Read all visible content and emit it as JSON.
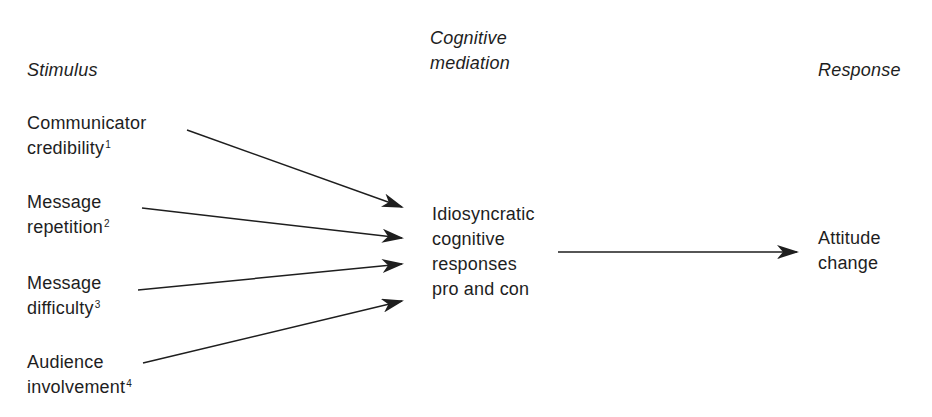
{
  "diagram": {
    "headers": {
      "stimulus": "Stimulus",
      "mediation_line1": "Cognitive",
      "mediation_line2": "mediation",
      "response": "Response"
    },
    "stimuli": [
      {
        "line1": "Communicator",
        "line2": "credibility",
        "footnote": "1"
      },
      {
        "line1": "Message",
        "line2": "repetition",
        "footnote": "2"
      },
      {
        "line1": "Message",
        "line2": "difficulty",
        "footnote": "3"
      },
      {
        "line1": "Audience",
        "line2": "involvement",
        "footnote": "4"
      }
    ],
    "mediation": {
      "lines": [
        "Idiosyncratic",
        "cognitive",
        "responses",
        "pro and con"
      ]
    },
    "response": {
      "line1": "Attitude",
      "line2": "change"
    },
    "colors": {
      "ink": "#1e1e1e",
      "background": "#ffffff"
    }
  }
}
